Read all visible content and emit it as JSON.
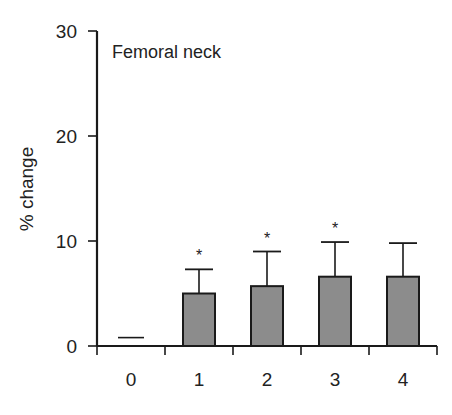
{
  "chart_data": {
    "type": "bar",
    "title": "Femoral neck",
    "xlabel": "",
    "ylabel": "% change",
    "categories": [
      "0",
      "1",
      "2",
      "3",
      "4"
    ],
    "values": [
      0.8,
      5.0,
      5.7,
      6.6,
      6.6
    ],
    "error_upper": [
      0,
      2.3,
      3.3,
      3.3,
      3.2
    ],
    "significance": [
      "",
      "*",
      "*",
      "*",
      ""
    ],
    "ylim": [
      0,
      30
    ],
    "yticks": [
      0,
      10,
      20,
      30
    ],
    "grid": false,
    "legend": null,
    "colors": {
      "bar_fill": "#8c8c8c",
      "bar_stroke": "#1a1a1a",
      "axis": "#1a1a1a"
    }
  }
}
